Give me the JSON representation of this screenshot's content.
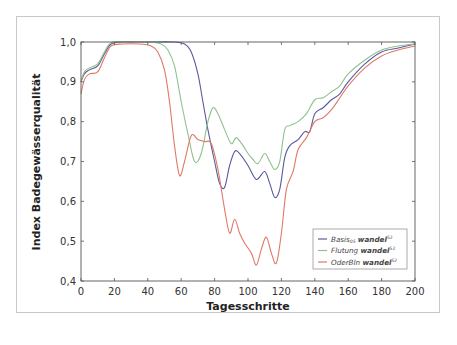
{
  "chart_data": {
    "type": "line",
    "title": "",
    "xlabel": "Tagesschritte",
    "ylabel": "Index Badegewässerqualität",
    "xlim": [
      0,
      200
    ],
    "ylim": [
      0.4,
      1.0
    ],
    "xticks": [
      0,
      20,
      40,
      60,
      80,
      100,
      120,
      140,
      160,
      180,
      200
    ],
    "yticks": [
      0.4,
      0.5,
      0.6,
      0.7,
      0.8,
      0.9,
      1.0
    ],
    "xtick_labels": [
      "0",
      "20",
      "40",
      "60",
      "80",
      "100",
      "120",
      "140",
      "160",
      "180",
      "200"
    ],
    "ytick_labels": [
      "0,4",
      "0,5",
      "0,6",
      "0,7",
      "0,8",
      "0,9",
      "1,0"
    ],
    "grid": false,
    "legend_position": "lower right",
    "series": [
      {
        "name": "Basis05 wandel52",
        "legend_main": "Basis",
        "legend_sub": "05",
        "legend_bold": "wandel",
        "legend_sup": "52",
        "color": "#5a5a9e",
        "x": [
          0,
          2,
          5,
          10,
          14,
          18,
          25,
          40,
          55,
          62,
          66,
          70,
          73,
          76,
          80,
          83,
          86,
          89,
          92,
          95,
          100,
          105,
          110,
          113,
          116,
          119,
          122,
          125,
          130,
          134,
          137,
          140,
          145,
          150,
          155,
          160,
          170,
          180,
          190,
          200
        ],
        "y": [
          0.9,
          0.92,
          0.93,
          0.94,
          0.97,
          0.995,
          1.0,
          1.0,
          1.0,
          0.995,
          0.975,
          0.92,
          0.85,
          0.78,
          0.7,
          0.645,
          0.635,
          0.69,
          0.725,
          0.72,
          0.69,
          0.655,
          0.675,
          0.645,
          0.61,
          0.63,
          0.71,
          0.74,
          0.755,
          0.775,
          0.775,
          0.82,
          0.835,
          0.855,
          0.87,
          0.9,
          0.945,
          0.975,
          0.985,
          0.995
        ]
      },
      {
        "name": "Flutung wandel52",
        "legend_main": "Flutung",
        "legend_sub": "",
        "legend_bold": "wandel",
        "legend_sup": "52",
        "color": "#8fc08f",
        "x": [
          0,
          2,
          5,
          10,
          14,
          18,
          25,
          40,
          48,
          52,
          56,
          60,
          64,
          68,
          72,
          76,
          79,
          82,
          86,
          90,
          93,
          97,
          100,
          103,
          106,
          110,
          113,
          116,
          119,
          122,
          125,
          130,
          135,
          140,
          145,
          150,
          155,
          160,
          170,
          180,
          190,
          200
        ],
        "y": [
          0.9,
          0.925,
          0.935,
          0.945,
          0.975,
          0.998,
          1.0,
          1.0,
          0.995,
          0.98,
          0.94,
          0.85,
          0.77,
          0.7,
          0.72,
          0.8,
          0.835,
          0.82,
          0.78,
          0.745,
          0.76,
          0.74,
          0.72,
          0.705,
          0.695,
          0.72,
          0.7,
          0.68,
          0.7,
          0.78,
          0.79,
          0.8,
          0.82,
          0.855,
          0.86,
          0.875,
          0.89,
          0.92,
          0.955,
          0.98,
          0.99,
          0.995
        ]
      },
      {
        "name": "OderBln wandel52",
        "legend_main": "OderBln",
        "legend_sub": "",
        "legend_bold": "wandel",
        "legend_sup": "52",
        "color": "#e07868",
        "x": [
          0,
          2,
          5,
          10,
          14,
          18,
          25,
          35,
          42,
          46,
          50,
          53,
          56,
          59,
          62,
          66,
          70,
          74,
          78,
          82,
          86,
          89,
          92,
          95,
          98,
          102,
          105,
          108,
          111,
          114,
          117,
          120,
          123,
          127,
          130,
          135,
          140,
          145,
          150,
          155,
          160,
          170,
          180,
          190,
          200
        ],
        "y": [
          0.87,
          0.905,
          0.92,
          0.925,
          0.96,
          0.99,
          0.995,
          0.995,
          0.99,
          0.975,
          0.93,
          0.85,
          0.74,
          0.665,
          0.7,
          0.765,
          0.755,
          0.75,
          0.745,
          0.68,
          0.58,
          0.52,
          0.555,
          0.52,
          0.495,
          0.47,
          0.44,
          0.48,
          0.51,
          0.47,
          0.445,
          0.52,
          0.63,
          0.675,
          0.73,
          0.76,
          0.8,
          0.81,
          0.83,
          0.86,
          0.89,
          0.935,
          0.965,
          0.98,
          0.99
        ]
      }
    ]
  },
  "axes": {
    "xlabel": "Tagesschritte",
    "ylabel": "Index Badegewässerqualität"
  }
}
